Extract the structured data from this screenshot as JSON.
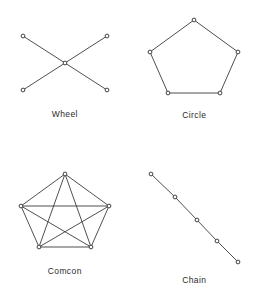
{
  "figure": {
    "background_color": "#ffffff",
    "line_color": "#3b3b3b",
    "node_fill_color": "#ffffff",
    "node_stroke_color": "#2e2e2e",
    "label_color": "#2a2a2a"
  },
  "chart_data": {
    "type": "diagram",
    "title": "",
    "layout": {
      "rows": 2,
      "columns": 2,
      "grid": true,
      "legend": "none"
    },
    "panels": [
      {
        "id": "wheel",
        "label": "Wheel",
        "position": "top-left",
        "node_count": 5,
        "edge_count": 4,
        "topology": "star/hub-and-spoke (X shape)",
        "viewbox": [
          0,
          0,
          100,
          70
        ],
        "nodes": [
          {
            "id": "n1",
            "x": 8,
            "y": 8
          },
          {
            "id": "n2",
            "x": 92,
            "y": 8
          },
          {
            "id": "n3",
            "x": 50,
            "y": 35
          },
          {
            "id": "n4",
            "x": 8,
            "y": 62
          },
          {
            "id": "n5",
            "x": 92,
            "y": 62
          }
        ],
        "edges": [
          [
            "n1",
            "n3"
          ],
          [
            "n2",
            "n3"
          ],
          [
            "n3",
            "n4"
          ],
          [
            "n3",
            "n5"
          ]
        ]
      },
      {
        "id": "circle",
        "label": "Circle",
        "position": "top-right",
        "node_count": 5,
        "edge_count": 5,
        "topology": "ring / pentagon cycle",
        "viewbox": [
          0,
          0,
          100,
          85
        ],
        "nodes": [
          {
            "id": "n1",
            "x": 50,
            "y": 6
          },
          {
            "id": "n2",
            "x": 6,
            "y": 38
          },
          {
            "id": "n3",
            "x": 94,
            "y": 38
          },
          {
            "id": "n4",
            "x": 24,
            "y": 79
          },
          {
            "id": "n5",
            "x": 76,
            "y": 79
          }
        ],
        "edges": [
          [
            "n1",
            "n2"
          ],
          [
            "n1",
            "n3"
          ],
          [
            "n2",
            "n4"
          ],
          [
            "n3",
            "n5"
          ],
          [
            "n4",
            "n5"
          ]
        ]
      },
      {
        "id": "comcon",
        "label": "Comcon",
        "position": "bottom-left",
        "node_count": 5,
        "edge_count": 10,
        "topology": "fully connected / complete graph K5",
        "viewbox": [
          0,
          0,
          100,
          85
        ],
        "nodes": [
          {
            "id": "n1",
            "x": 50,
            "y": 6
          },
          {
            "id": "n2",
            "x": 6,
            "y": 38
          },
          {
            "id": "n3",
            "x": 94,
            "y": 38
          },
          {
            "id": "n4",
            "x": 24,
            "y": 79
          },
          {
            "id": "n5",
            "x": 76,
            "y": 79
          }
        ],
        "edges": [
          [
            "n1",
            "n2"
          ],
          [
            "n1",
            "n3"
          ],
          [
            "n1",
            "n4"
          ],
          [
            "n1",
            "n5"
          ],
          [
            "n2",
            "n3"
          ],
          [
            "n2",
            "n4"
          ],
          [
            "n2",
            "n5"
          ],
          [
            "n3",
            "n4"
          ],
          [
            "n3",
            "n5"
          ],
          [
            "n4",
            "n5"
          ]
        ]
      },
      {
        "id": "chain",
        "label": "Chain",
        "position": "bottom-right",
        "node_count": 5,
        "edge_count": 4,
        "topology": "linear path / chain",
        "viewbox": [
          0,
          0,
          100,
          100
        ],
        "nodes": [
          {
            "id": "n1",
            "x": 7,
            "y": 6
          },
          {
            "id": "n2",
            "x": 31,
            "y": 29
          },
          {
            "id": "n3",
            "x": 53,
            "y": 52
          },
          {
            "id": "n4",
            "x": 73,
            "y": 73
          },
          {
            "id": "n5",
            "x": 94,
            "y": 94
          }
        ],
        "edges": [
          [
            "n1",
            "n2"
          ],
          [
            "n2",
            "n3"
          ],
          [
            "n3",
            "n4"
          ],
          [
            "n4",
            "n5"
          ]
        ]
      }
    ]
  }
}
